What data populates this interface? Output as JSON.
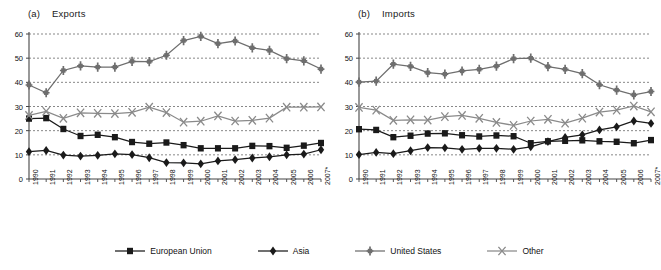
{
  "figure": {
    "panels": [
      {
        "tag": "(a)",
        "title": "Exports"
      },
      {
        "tag": "(b)",
        "title": "Imports"
      }
    ]
  },
  "legend": {
    "position": "bottom-center",
    "items": [
      {
        "label": "European Union",
        "marker": "square-marker-icon",
        "color": "#1a1a1a"
      },
      {
        "label": "Asia",
        "marker": "diamond-marker-icon",
        "color": "#1a1a1a"
      },
      {
        "label": "United States",
        "marker": "plus-marker-icon",
        "color": "#6e6e6e"
      },
      {
        "label": "Other",
        "marker": "x-marker-icon",
        "color": "#8a8a8a"
      }
    ]
  },
  "chart_data": [
    {
      "type": "line",
      "title": "Exports",
      "panel_tag": "(a)",
      "xlabel": "",
      "ylabel": "",
      "grid": true,
      "legend_position": "bottom-center",
      "xlim": [
        1990,
        2007
      ],
      "ylim": [
        0,
        60
      ],
      "yticks": [
        0,
        10,
        20,
        30,
        40,
        50,
        60
      ],
      "categories": [
        "1990",
        "1991",
        "1992",
        "1993",
        "1994",
        "1995",
        "1996",
        "1997",
        "1998",
        "1999",
        "2000",
        "2001",
        "2002",
        "2003",
        "2004",
        "2005",
        "2006",
        "2007*"
      ],
      "series": [
        {
          "name": "European Union",
          "marker": "square",
          "color": "#1a1a1a",
          "values": [
            25.0,
            25.2,
            20.7,
            17.8,
            18.3,
            17.3,
            15.3,
            14.6,
            15.1,
            14.0,
            12.7,
            12.7,
            12.7,
            13.7,
            13.6,
            12.9,
            13.8,
            14.9
          ]
        },
        {
          "name": "Asia",
          "marker": "diamond",
          "color": "#1a1a1a",
          "values": [
            11.3,
            11.8,
            9.9,
            9.5,
            9.8,
            10.4,
            10.1,
            8.8,
            6.8,
            6.7,
            6.3,
            7.5,
            8.0,
            8.7,
            9.2,
            10.0,
            10.3,
            12.1
          ]
        },
        {
          "name": "United States",
          "marker": "plus",
          "color": "#6e6e6e",
          "values": [
            38.9,
            35.7,
            44.9,
            46.8,
            46.3,
            46.3,
            48.7,
            48.6,
            51.2,
            57.3,
            59.0,
            56.0,
            57.1,
            54.3,
            53.2,
            49.8,
            48.9,
            45.5
          ]
        },
        {
          "name": "Other",
          "marker": "x",
          "color": "#8a8a8a",
          "values": [
            26.3,
            28.0,
            25.1,
            27.4,
            27.2,
            27.1,
            27.6,
            29.7,
            27.5,
            23.5,
            23.9,
            26.1,
            24.0,
            24.3,
            25.2,
            29.7,
            29.7,
            29.8
          ]
        }
      ]
    },
    {
      "type": "line",
      "title": "Imports",
      "panel_tag": "(b)",
      "xlabel": "",
      "ylabel": "",
      "grid": true,
      "legend_position": "bottom-center",
      "xlim": [
        1990,
        2007
      ],
      "ylim": [
        0,
        60
      ],
      "yticks": [
        0,
        10,
        20,
        30,
        40,
        50,
        60
      ],
      "categories": [
        "1990",
        "1991",
        "1992",
        "1993",
        "1994",
        "1995",
        "1996",
        "1997",
        "1998",
        "1999",
        "2000",
        "2001",
        "2002",
        "2003",
        "2004",
        "2005",
        "2006",
        "2007*"
      ],
      "series": [
        {
          "name": "European Union",
          "marker": "square",
          "color": "#1a1a1a",
          "values": [
            20.6,
            20.3,
            17.3,
            17.9,
            18.8,
            18.9,
            18.1,
            17.6,
            18.0,
            17.7,
            14.8,
            15.6,
            15.8,
            16.0,
            15.6,
            15.4,
            14.8,
            16.1
          ]
        },
        {
          "name": "Asia",
          "marker": "diamond",
          "color": "#1a1a1a",
          "values": [
            10.1,
            11.0,
            10.5,
            11.7,
            13.0,
            12.9,
            12.3,
            12.7,
            12.7,
            12.3,
            13.3,
            15.5,
            17.2,
            18.3,
            20.3,
            21.6,
            24.0,
            23.0
          ]
        },
        {
          "name": "United States",
          "marker": "plus",
          "color": "#6e6e6e",
          "values": [
            40.1,
            40.5,
            47.5,
            46.6,
            44.0,
            43.4,
            44.7,
            45.4,
            46.7,
            49.8,
            50.0,
            46.5,
            45.4,
            43.6,
            39.0,
            36.8,
            34.8,
            36.2
          ]
        },
        {
          "name": "Other",
          "marker": "x",
          "color": "#8a8a8a",
          "values": [
            29.6,
            28.5,
            24.3,
            24.5,
            24.4,
            25.8,
            26.3,
            25.1,
            23.4,
            22.2,
            24.0,
            24.7,
            23.1,
            25.2,
            27.7,
            28.5,
            30.2,
            27.8
          ]
        }
      ]
    }
  ]
}
